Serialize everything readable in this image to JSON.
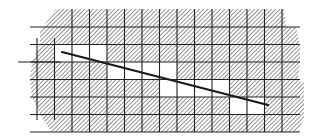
{
  "diagram": {
    "title": "",
    "type": "line-rasterization-grid",
    "colors": {
      "background": "#ffffff",
      "hatch": "#8a8a8a",
      "grid": "#222222",
      "line": "#1a1a1a",
      "white_cell": "#ffffff"
    },
    "grid": {
      "x_lines": [
        37,
        54.5,
        72,
        89.5,
        107,
        124.5,
        142,
        159.5,
        177,
        194.5,
        212,
        229.5,
        247,
        264.5,
        282
      ],
      "y_lines": [
        27,
        44.5,
        62,
        79.5,
        97,
        114.5,
        132
      ]
    },
    "hatched_region_outline": [
      [
        55,
        27
      ],
      [
        300,
        27
      ],
      [
        300,
        38
      ],
      [
        282,
        38
      ],
      [
        300,
        80
      ],
      [
        300,
        114
      ],
      [
        297,
        132
      ],
      [
        160,
        132
      ],
      [
        150,
        120
      ],
      [
        107,
        120
      ],
      [
        107,
        97
      ],
      [
        90,
        97
      ],
      [
        80,
        90
      ],
      [
        78,
        62
      ],
      [
        88,
        44
      ],
      [
        110,
        44
      ],
      [
        108,
        40
      ]
    ],
    "white_cells": [
      {
        "row": 1,
        "cols": [
          1,
          2,
          3
        ]
      },
      {
        "row": 2,
        "cols": [
          4,
          5,
          6,
          7
        ]
      },
      {
        "row": 3,
        "cols": [
          7,
          8,
          9,
          10
        ]
      },
      {
        "row": 4,
        "cols": [
          11,
          12
        ]
      }
    ],
    "axis_line": {
      "x1": 18,
      "y1": 62,
      "x2": 60,
      "y2": 62
    },
    "left_tick": {
      "x": 37,
      "y1": 38,
      "y2": 97
    },
    "segment": {
      "x1": 62,
      "y1": 52,
      "x2": 268,
      "y2": 105
    }
  }
}
